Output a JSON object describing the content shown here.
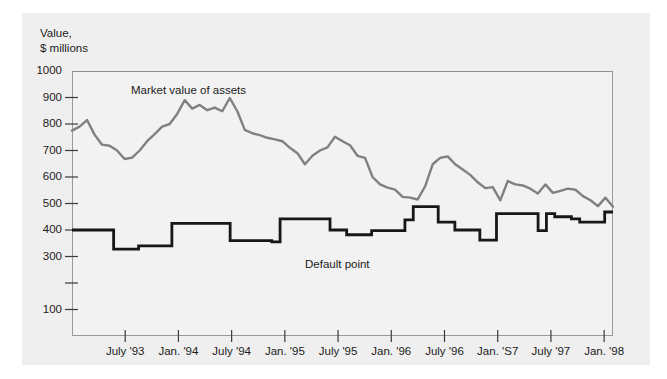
{
  "figure": {
    "axis_title_line1": "Value,",
    "axis_title_line2": "$ millions",
    "background_color": "#efefef",
    "plot_background_color": "#f2f2f2",
    "frame_color": "#9a9a9a"
  },
  "chart_data": {
    "type": "line",
    "title": "",
    "subtitle": "",
    "xlabel": "",
    "ylabel": "Value, $ millions",
    "ylim": [
      0,
      1000
    ],
    "xlim": [
      0,
      61
    ],
    "grid": false,
    "legend_position": "inline-annotation",
    "ytick_labels": [
      "1000",
      "900",
      "800",
      "700",
      "600",
      "500",
      "400",
      "300",
      "100"
    ],
    "ytick_values": [
      1000,
      900,
      800,
      700,
      600,
      500,
      400,
      300,
      100
    ],
    "ytick_all_values": [
      1000,
      900,
      800,
      700,
      600,
      500,
      400,
      300,
      200,
      100
    ],
    "xtick_labels": [
      "July '93",
      "Jan. '94",
      "July '94",
      "Jan. '95",
      "July '95",
      "Jan. '96",
      "July '96",
      "Jan. 'S7",
      "July '97",
      "Jan. '98"
    ],
    "xtick_positions": [
      6,
      12,
      18,
      24,
      30,
      36,
      42,
      48,
      54,
      60
    ],
    "annotations": [
      {
        "text": "Market value of assets",
        "x": 131,
        "y": 84
      },
      {
        "text": "Default point",
        "x": 305,
        "y": 258
      }
    ],
    "series": [
      {
        "name": "Market value of assets",
        "color": "#808080",
        "line_width": 2.4,
        "values": [
          775,
          790,
          815,
          760,
          722,
          718,
          700,
          668,
          673,
          700,
          735,
          762,
          790,
          800,
          838,
          890,
          858,
          872,
          852,
          862,
          848,
          898,
          848,
          778,
          765,
          758,
          748,
          742,
          735,
          710,
          690,
          648,
          680,
          700,
          712,
          752,
          735,
          720,
          680,
          672,
          600,
          572,
          560,
          552,
          525,
          522,
          515,
          565,
          648,
          672,
          678,
          648,
          628,
          608,
          580,
          558,
          562,
          512,
          585,
          572,
          568,
          556,
          538,
          572,
          540,
          548,
          556,
          552,
          528,
          512,
          490,
          522,
          488
        ]
      },
      {
        "name": "Default point",
        "color": "#171717",
        "line_width": 2.8,
        "step": true,
        "values": [
          400,
          400,
          400,
          400,
          400,
          328,
          328,
          328,
          340,
          340,
          340,
          340,
          425,
          425,
          425,
          425,
          425,
          425,
          425,
          360,
          360,
          360,
          360,
          360,
          355,
          442,
          442,
          442,
          442,
          442,
          442,
          400,
          400,
          382,
          382,
          382,
          398,
          398,
          398,
          398,
          438,
          488,
          488,
          488,
          430,
          430,
          400,
          400,
          400,
          362,
          362,
          462,
          462,
          462,
          462,
          462,
          398,
          462,
          450,
          450,
          442,
          430,
          430,
          430,
          468,
          468
        ]
      }
    ]
  }
}
